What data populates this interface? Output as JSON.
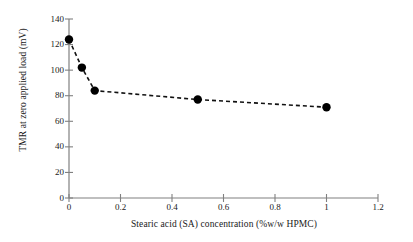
{
  "chart_data": {
    "type": "line",
    "title": "",
    "xlabel": "Stearic acid (SA) concentration (%w/w HPMC)",
    "ylabel": "TMR at zero applied load (mV)",
    "xlim": [
      0,
      1.2
    ],
    "ylim": [
      0,
      140
    ],
    "xticks": [
      0,
      0.2,
      0.4,
      0.6,
      0.8,
      1,
      1.2
    ],
    "xtick_labels": [
      "0",
      "0.2",
      "0.4",
      "0.6",
      "0.8",
      "1",
      "1.2"
    ],
    "yticks": [
      0,
      20,
      40,
      60,
      80,
      100,
      120,
      140
    ],
    "ytick_labels": [
      "0",
      "20",
      "40",
      "60",
      "80",
      "100",
      "120",
      "140"
    ],
    "grid": false,
    "legend": false,
    "line_style": "dashed",
    "marker": "filled-circle",
    "series": [
      {
        "name": "TMR at zero applied load",
        "x": [
          0,
          0.05,
          0.1,
          0.5,
          1
        ],
        "values": [
          124,
          102,
          84,
          77,
          71
        ]
      }
    ],
    "colors": {
      "axis": "#808080",
      "line": "#111111",
      "marker": "#000000",
      "text": "#1a1a1a",
      "background": "#ffffff"
    }
  }
}
